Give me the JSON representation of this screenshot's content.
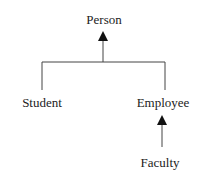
{
  "diagram": {
    "type": "class-inheritance",
    "nodes": {
      "person": "Person",
      "student": "Student",
      "employee": "Employee",
      "faculty": "Faculty"
    },
    "edges": [
      {
        "from": "Student",
        "to": "Person"
      },
      {
        "from": "Employee",
        "to": "Person"
      },
      {
        "from": "Faculty",
        "to": "Employee"
      }
    ],
    "colors": {
      "line": "#333333",
      "text": "#222222"
    }
  }
}
